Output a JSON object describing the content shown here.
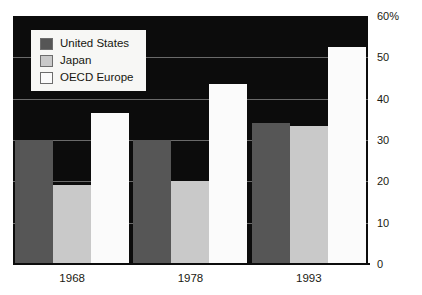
{
  "chart_data": {
    "type": "bar",
    "title": "",
    "subtitle": "",
    "xlabel": "",
    "ylabel": "",
    "categories": [
      "1968",
      "1978",
      "1993"
    ],
    "series": [
      {
        "name": "United States",
        "color": "#565656",
        "values": [
          30,
          30,
          34
        ]
      },
      {
        "name": "Japan",
        "color": "#c9c9c9",
        "values": [
          19,
          20,
          33.5
        ]
      },
      {
        "name": "OECD Europe",
        "color": "#fbfbfb",
        "values": [
          36.5,
          43.5,
          52.5
        ]
      }
    ],
    "ylim": [
      0,
      60
    ],
    "ytick_labels": [
      "60%",
      "50",
      "40",
      "30",
      "20",
      "10",
      "0"
    ],
    "ytick_values": [
      60,
      50,
      40,
      30,
      20,
      10,
      0
    ],
    "grid": true,
    "grid_axis": "y",
    "legend_position": "top-left",
    "plot_background": "#0c0c0c",
    "gridline_color": "#6a6a6a"
  },
  "legend": {
    "items": [
      {
        "label": "United States"
      },
      {
        "label": "Japan"
      },
      {
        "label": "OECD Europe"
      }
    ]
  }
}
